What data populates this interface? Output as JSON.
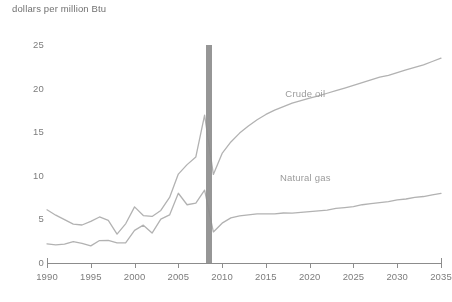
{
  "chart_data": {
    "type": "line",
    "title": "dollars per million Btu",
    "xlabel": "",
    "ylabel": "dollars per million Btu",
    "xlim": [
      1990,
      2035
    ],
    "ylim": [
      0,
      25
    ],
    "grid": false,
    "legend_position": "inline-annotation",
    "y_ticks": [
      0,
      5,
      10,
      15,
      20,
      25
    ],
    "y_tick_labels": [
      "0",
      "5",
      "10",
      "15",
      "20",
      "25"
    ],
    "x_ticks": [
      1990,
      1995,
      2000,
      2005,
      2010,
      2015,
      2020,
      2025,
      2030,
      2035
    ],
    "x_tick_labels": [
      "1990",
      "1995",
      "2000",
      "2005",
      "2010",
      "2015",
      "2020",
      "2025",
      "2030",
      "2035"
    ],
    "annotations": [
      {
        "text": "Crude oil",
        "x": 2019.5,
        "y": 19.3
      },
      {
        "text": "Natural gas",
        "x": 2019.5,
        "y": 9.6
      }
    ],
    "divider": {
      "x": 2008.5,
      "label": "",
      "color": "#8b8b8b"
    },
    "x": [
      1990,
      1991,
      1992,
      1993,
      1994,
      1995,
      1996,
      1997,
      1998,
      1999,
      2000,
      2001,
      2002,
      2003,
      2004,
      2005,
      2006,
      2007,
      2008,
      2009,
      2010,
      2011,
      2012,
      2013,
      2014,
      2015,
      2016,
      2017,
      2018,
      2019,
      2020,
      2021,
      2022,
      2023,
      2024,
      2025,
      2026,
      2027,
      2028,
      2029,
      2030,
      2031,
      2032,
      2033,
      2034,
      2035
    ],
    "series": [
      {
        "name": "Crude oil",
        "color": "#b2b2b2",
        "values": [
          6.1,
          5.5,
          5.0,
          4.5,
          4.4,
          4.8,
          5.3,
          4.9,
          3.3,
          4.5,
          6.4,
          5.4,
          5.3,
          6.0,
          7.5,
          10.2,
          11.3,
          12.2,
          17.0,
          10.2,
          12.6,
          13.9,
          14.9,
          15.7,
          16.4,
          17.0,
          17.5,
          17.9,
          18.3,
          18.6,
          18.9,
          19.2,
          19.5,
          19.8,
          20.1,
          20.4,
          20.7,
          21.0,
          21.3,
          21.5,
          21.8,
          22.1,
          22.4,
          22.7,
          23.1,
          23.5
        ]
      },
      {
        "name": "Natural gas",
        "color": "#b2b2b2",
        "values": [
          2.2,
          2.1,
          2.2,
          2.5,
          2.3,
          2.0,
          2.6,
          2.6,
          2.3,
          2.3,
          3.7,
          4.3,
          3.4,
          5.0,
          5.5,
          8.0,
          6.7,
          6.9,
          8.4,
          3.6,
          4.6,
          5.2,
          5.4,
          5.5,
          5.6,
          5.6,
          5.6,
          5.7,
          5.7,
          5.8,
          5.9,
          6.0,
          6.1,
          6.3,
          6.4,
          6.5,
          6.7,
          6.8,
          6.9,
          7.0,
          7.2,
          7.3,
          7.5,
          7.6,
          7.8,
          8.0
        ]
      }
    ]
  },
  "colors": {
    "line": "#b2b2b2",
    "axis": "#8a8a8a",
    "text": "#7a7a7a",
    "annotation": "#9a9a9a",
    "divider": "#8b8b8b",
    "background": "#ffffff"
  }
}
